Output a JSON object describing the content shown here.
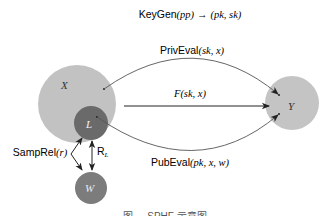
{
  "title": {
    "func": "KeyGen",
    "args": "(pp)",
    "arrow": " → ",
    "result": "(pk, sk)"
  },
  "nodes": {
    "X": {
      "label": "X",
      "color": "#c2c2c2"
    },
    "L": {
      "label": "L",
      "color": "#6a6a6a"
    },
    "W": {
      "label": "W",
      "color": "#7c7c7c"
    },
    "Y": {
      "label": "Y",
      "color": "#c4c4c4"
    }
  },
  "edges": {
    "priv_eval": {
      "func": "PrivEval",
      "args": "(sk, x)"
    },
    "f": {
      "func": "F",
      "args": "(sk, x)"
    },
    "pub_eval": {
      "func": "PubEval",
      "args": "(pk, x, w)"
    },
    "samp_rel": {
      "func": "SampRel",
      "args": "(r)"
    },
    "relation": {
      "func": "R",
      "sub": "L"
    }
  },
  "caption": "图 ... SPHF 示意图"
}
